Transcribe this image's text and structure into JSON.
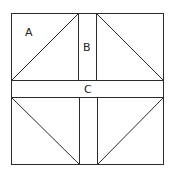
{
  "diagram": {
    "type": "quilt-block",
    "labels": [
      {
        "id": "A",
        "text": "A",
        "region": "top-left half-square triangle"
      },
      {
        "id": "B",
        "text": "B",
        "region": "vertical strip"
      },
      {
        "id": "C",
        "text": "C",
        "region": "horizontal strip"
      }
    ],
    "colors": {
      "stroke": "#2b2b2b",
      "background": "#ffffff",
      "text": "#222222"
    }
  }
}
